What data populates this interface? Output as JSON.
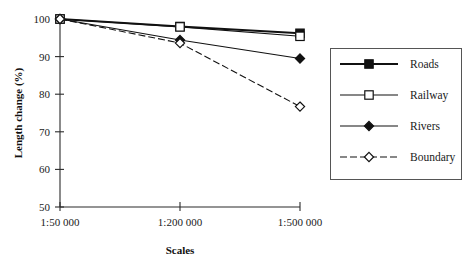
{
  "chart_data": {
    "type": "line",
    "title": "",
    "xlabel": "Scales",
    "ylabel": "Length change (%)",
    "categories": [
      "1:50 000",
      "1:200 000",
      "1:500 000"
    ],
    "ylim": [
      50,
      100
    ],
    "yticks": [
      50,
      60,
      70,
      80,
      90,
      100
    ],
    "ytick_labels": [
      "50",
      "60",
      "70",
      "80",
      "90",
      "100"
    ],
    "grid": false,
    "legend_position": "right-outside",
    "series": [
      {
        "name": "Roads",
        "values": [
          100,
          98.0,
          96.2
        ],
        "marker": "filled-square",
        "line": "solid"
      },
      {
        "name": "Railway",
        "values": [
          100,
          97.9,
          95.4
        ],
        "marker": "open-square",
        "line": "solid"
      },
      {
        "name": "Rivers",
        "values": [
          100,
          94.4,
          89.5
        ],
        "marker": "filled-diamond",
        "line": "solid"
      },
      {
        "name": "Boundary",
        "values": [
          100,
          93.6,
          76.7
        ],
        "marker": "open-diamond",
        "line": "dashed"
      }
    ]
  },
  "axes": {
    "y_title": "Length change (%)",
    "x_title": "Scales",
    "y_tick_100": "100",
    "y_tick_90": "90",
    "y_tick_80": "80",
    "y_tick_70": "70",
    "y_tick_60": "60",
    "y_tick_50": "50",
    "x_tick_1": "1:50 000",
    "x_tick_2": "1:200 000",
    "x_tick_3": "1:500 000"
  },
  "legend": {
    "items": [
      {
        "label": "Roads"
      },
      {
        "label": "Railway"
      },
      {
        "label": "Rivers"
      },
      {
        "label": "Boundary"
      }
    ]
  },
  "colors": {
    "ink": "#111111",
    "axis": "#2b2b2b",
    "legend_border": "#555555",
    "background": "#ffffff"
  }
}
